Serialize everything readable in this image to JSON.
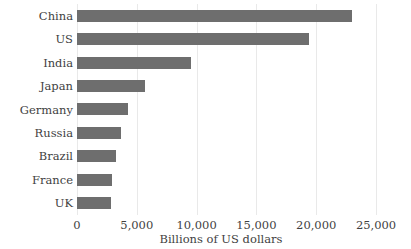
{
  "chart_data": {
    "type": "bar",
    "orientation": "horizontal",
    "title": "",
    "xlabel": "Billions of US dollars",
    "ylabel": "",
    "categories": [
      "China",
      "US",
      "India",
      "Japan",
      "Germany",
      "Russia",
      "Brazil",
      "France",
      "UK"
    ],
    "values": [
      23000,
      19400,
      9500,
      5700,
      4300,
      3650,
      3250,
      2900,
      2850
    ],
    "xlim": [
      0,
      25000
    ],
    "xticks": [
      0,
      5000,
      10000,
      15000,
      20000,
      25000
    ],
    "xticklabels": [
      "0",
      "5,000",
      "10,000",
      "15,000",
      "20,000",
      "25,000"
    ],
    "grid": "vertical",
    "legend": "none",
    "bar_color": "#6e6e6e",
    "grid_color": "#e9e9e9",
    "text_color": "#3f3f3f",
    "background_color": "#ffffff"
  }
}
